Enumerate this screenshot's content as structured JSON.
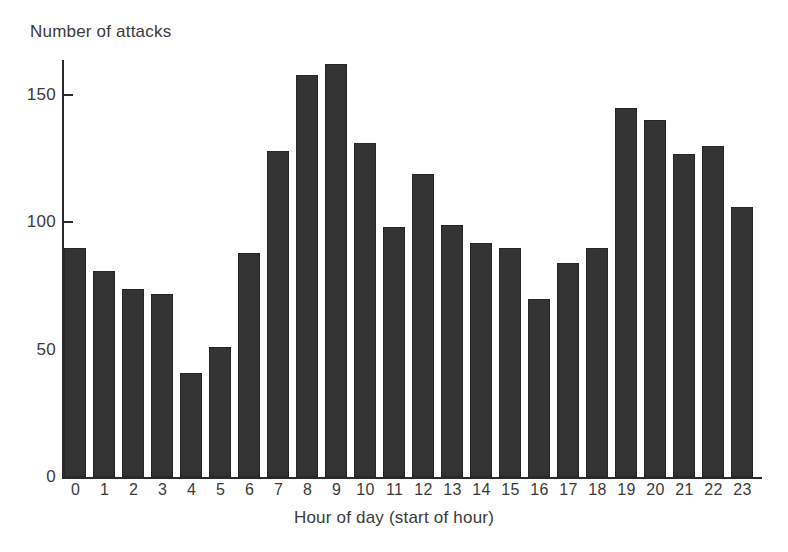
{
  "chart_data": {
    "type": "bar",
    "title": "",
    "ylabel": "Number of attacks",
    "xlabel": "Hour of day (start of hour)",
    "categories": [
      "0",
      "1",
      "2",
      "3",
      "4",
      "5",
      "6",
      "7",
      "8",
      "9",
      "10",
      "11",
      "12",
      "13",
      "14",
      "15",
      "16",
      "17",
      "18",
      "19",
      "20",
      "21",
      "22",
      "23"
    ],
    "values": [
      90,
      81,
      74,
      72,
      41,
      51,
      88,
      128,
      158,
      162,
      131,
      98,
      119,
      99,
      92,
      90,
      70,
      84,
      90,
      145,
      140,
      127,
      130,
      106
    ],
    "ylim": [
      0,
      170
    ],
    "yticks": [
      0,
      50,
      100,
      150
    ],
    "ytick_labels": [
      "0",
      "50",
      "100",
      "150"
    ],
    "grid": false,
    "legend": false,
    "bar_color": "#333333",
    "axis_color": "#2b2b2b",
    "text_color": "#3b3b3b",
    "background": "#ffffff"
  }
}
